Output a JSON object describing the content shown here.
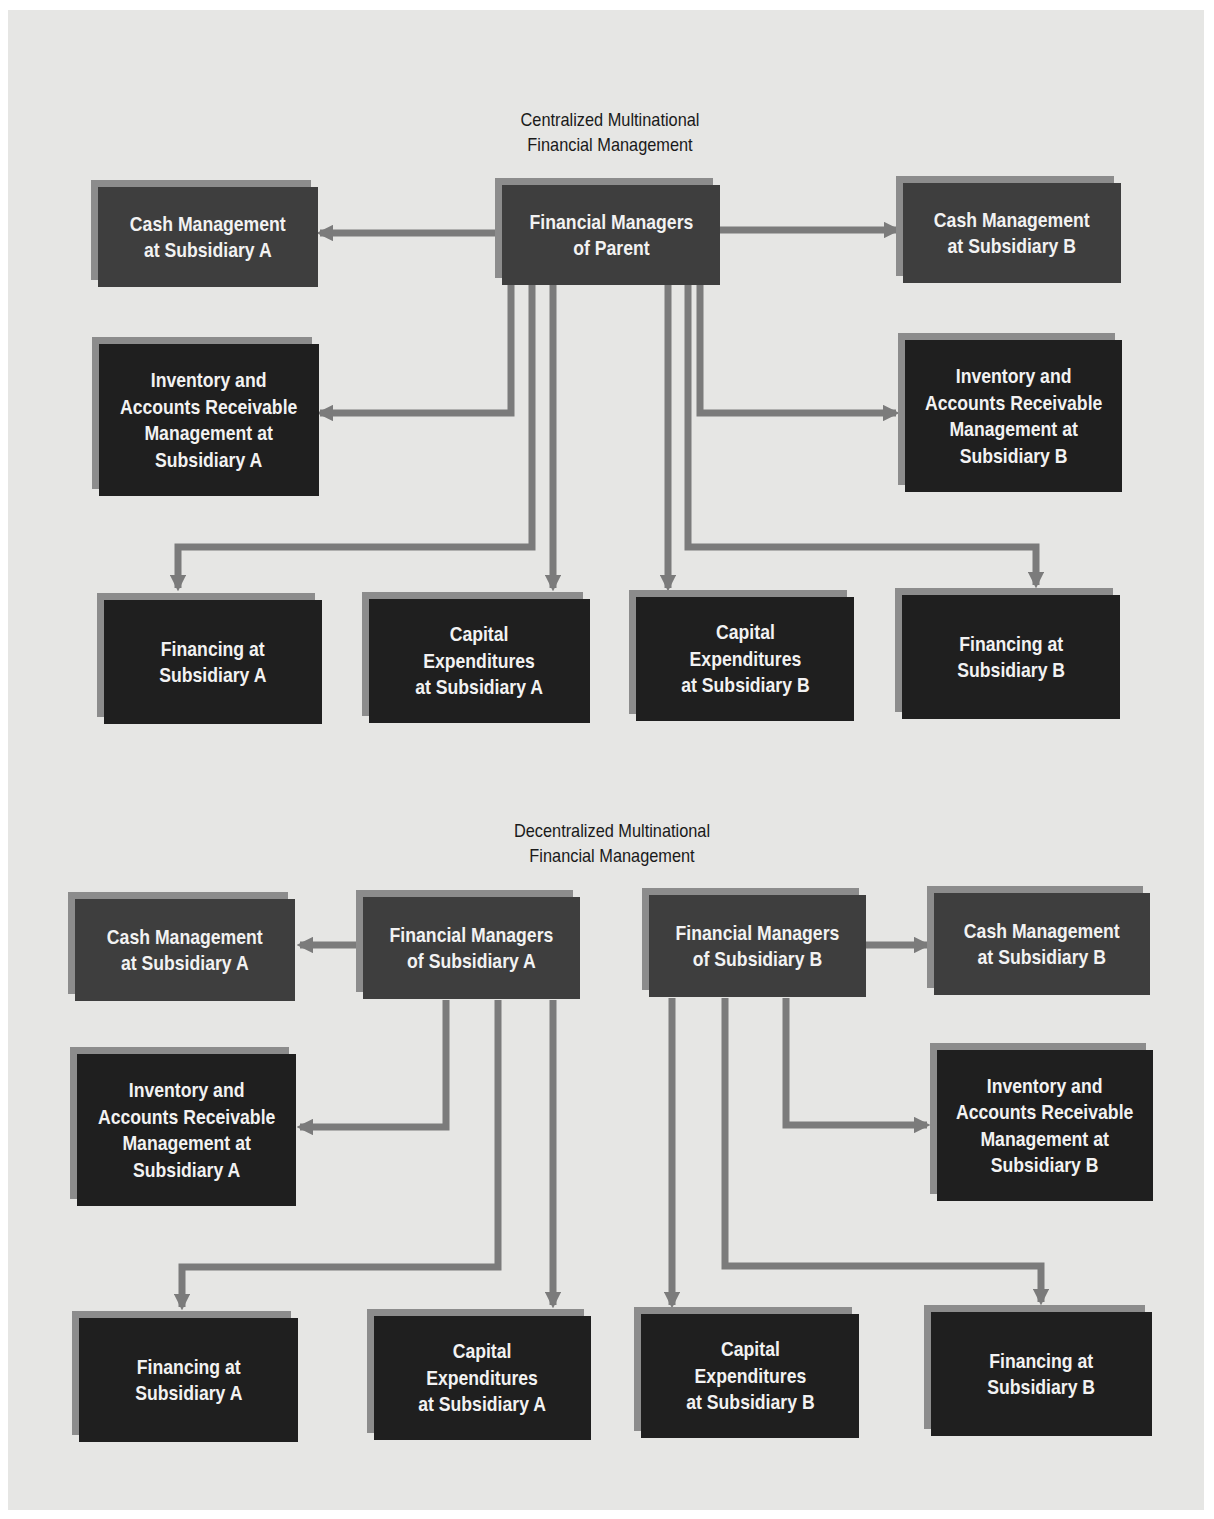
{
  "colors": {
    "background": "#e6e6e4",
    "box_medium": "#3e3e3e",
    "box_dark": "#1f1f1f",
    "box_shadow": "#8c8c8c",
    "connector": "#7b7b7b",
    "text_light": "#f2f2f2",
    "title_text": "#1a1a1a"
  },
  "centralized": {
    "title": "Centralized Multinational\nFinancial Management",
    "title_line1": "Centralized Multinational",
    "title_line2": "Financial Management",
    "parent": "Financial Managers\nof Parent",
    "cash_a": "Cash Management\nat Subsidiary A",
    "cash_b": "Cash Management\nat Subsidiary B",
    "inv_a": "Inventory and\nAccounts Receivable\nManagement at\nSubsidiary A",
    "inv_b": "Inventory and\nAccounts Receivable\nManagement at\nSubsidiary B",
    "fin_a": "Financing at\nSubsidiary A",
    "capex_a": "Capital\nExpenditures\nat Subsidiary A",
    "capex_b": "Capital\nExpenditures\nat Subsidiary B",
    "fin_b": "Financing at\nSubsidiary B"
  },
  "decentralized": {
    "title_line1": "Decentralized Multinational",
    "title_line2": "Financial Management",
    "mgr_a": "Financial Managers\nof Subsidiary A",
    "mgr_b": "Financial Managers\nof Subsidiary B",
    "cash_a": "Cash Management\nat Subsidiary A",
    "cash_b": "Cash Management\nat Subsidiary B",
    "inv_a": "Inventory and\nAccounts Receivable\nManagement at\nSubsidiary A",
    "inv_b": "Inventory and\nAccounts Receivable\nManagement at\nSubsidiary B",
    "fin_a": "Financing at\nSubsidiary A",
    "capex_a": "Capital\nExpenditures\nat Subsidiary A",
    "capex_b": "Capital\nExpenditures\nat Subsidiary B",
    "fin_b": "Financing at\nSubsidiary B"
  }
}
